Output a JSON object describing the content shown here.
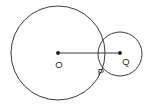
{
  "figure": {
    "background_color": "#ffffff",
    "stroke_color": "#3b3b3b",
    "label_color": "#2a2a2a",
    "dot_color": "#1d1d1d",
    "width": 147,
    "height": 107
  },
  "labels": {
    "center_large": "O",
    "tangent_point": "P",
    "center_small": "Q"
  },
  "chart_data": {
    "type": "diagram",
    "shapes": [
      {
        "name": "large-circle",
        "kind": "circle",
        "center_x": 58,
        "center_y": 53,
        "radius": 47,
        "fill": "none",
        "stroke": "#3b3b3b",
        "stroke_width": 1
      },
      {
        "name": "small-circle",
        "kind": "circle",
        "center_x": 120,
        "center_y": 54,
        "radius": 22,
        "fill": "none",
        "stroke": "#3b3b3b",
        "stroke_width": 1
      },
      {
        "name": "center-line",
        "kind": "segment",
        "x1": 58,
        "y1": 53,
        "x2": 120,
        "y2": 53,
        "stroke": "#3b3b3b",
        "stroke_width": 1
      }
    ],
    "points": [
      {
        "name": "O",
        "label": "O",
        "x": 58,
        "y": 53,
        "label_x": 59,
        "label_y": 65,
        "marker": "filled-dot"
      },
      {
        "name": "P",
        "label": "P",
        "x": 103,
        "y": 62,
        "label_x": 101,
        "label_y": 72,
        "marker": "none"
      },
      {
        "name": "Q",
        "label": "Q",
        "x": 120,
        "y": 53,
        "label_x": 126,
        "label_y": 62,
        "marker": "filled-dot"
      }
    ],
    "axis": {
      "grid": false,
      "xlim": [
        0,
        147
      ],
      "ylim": [
        0,
        107
      ]
    },
    "legend": null
  }
}
